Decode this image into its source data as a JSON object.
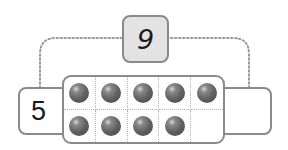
{
  "diagram": {
    "type": "number-bond-ten-frame",
    "whole": {
      "label": "9"
    },
    "parts": [
      {
        "position": "left",
        "label": "5"
      },
      {
        "position": "right",
        "label": ""
      }
    ],
    "ten_frame": {
      "rows": 2,
      "columns": 5,
      "filled_count": 9,
      "cells": [
        {
          "row": 0,
          "col": 0,
          "filled": true
        },
        {
          "row": 0,
          "col": 1,
          "filled": true
        },
        {
          "row": 0,
          "col": 2,
          "filled": true
        },
        {
          "row": 0,
          "col": 3,
          "filled": true
        },
        {
          "row": 0,
          "col": 4,
          "filled": true
        },
        {
          "row": 1,
          "col": 0,
          "filled": true
        },
        {
          "row": 1,
          "col": 1,
          "filled": true
        },
        {
          "row": 1,
          "col": 2,
          "filled": true
        },
        {
          "row": 1,
          "col": 3,
          "filled": true
        },
        {
          "row": 1,
          "col": 4,
          "filled": false
        }
      ]
    },
    "colors": {
      "border": "#8a8a8a",
      "whole_box_fill": "#e3e3e3",
      "counter": "#5e5e5e",
      "connector": "#9a9a9a"
    }
  }
}
